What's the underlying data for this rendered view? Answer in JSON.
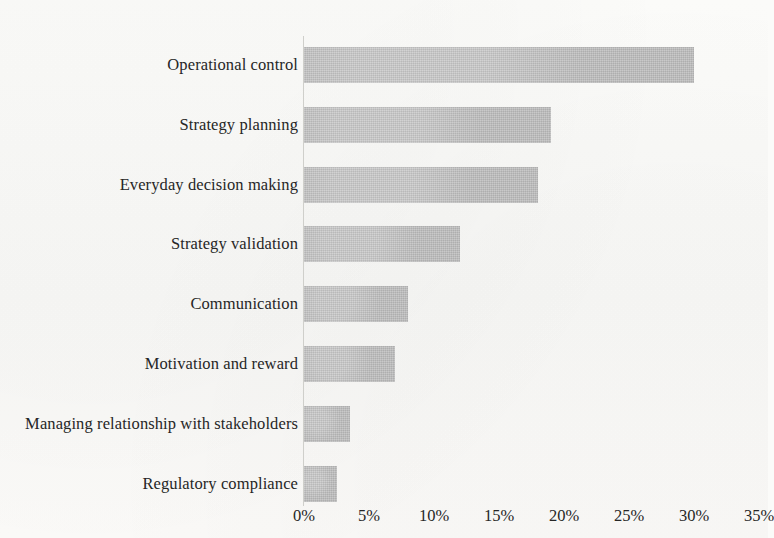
{
  "chart_data": {
    "type": "bar",
    "orientation": "horizontal",
    "title": "",
    "subtitle": "",
    "xlabel": "",
    "ylabel": "",
    "categories": [
      "Operational control",
      "Strategy planning",
      "Everyday decision making",
      "Strategy validation",
      "Communication",
      "Motivation and reward",
      "Managing relationship with stakeholders",
      "Regulatory compliance"
    ],
    "values": [
      30,
      19,
      18,
      12,
      8,
      7,
      3.5,
      2.5
    ],
    "value_labels": [
      "30%",
      "19%",
      "18%",
      "12%",
      "8%",
      "7%",
      "3.5%",
      "2.5%"
    ],
    "xlim": [
      0,
      35
    ],
    "xticks": [
      0,
      5,
      10,
      15,
      20,
      25,
      30,
      35
    ],
    "xtick_labels": [
      "0%",
      "5%",
      "10%",
      "15%",
      "20%",
      "25%",
      "30%",
      "35%"
    ],
    "grid": false,
    "legend": null,
    "legend_position": "none",
    "bar_color": "#bdbdbd",
    "text_color": "#262626",
    "background_color": "#fbfbf9",
    "axis_color": "#cfcfcb"
  }
}
